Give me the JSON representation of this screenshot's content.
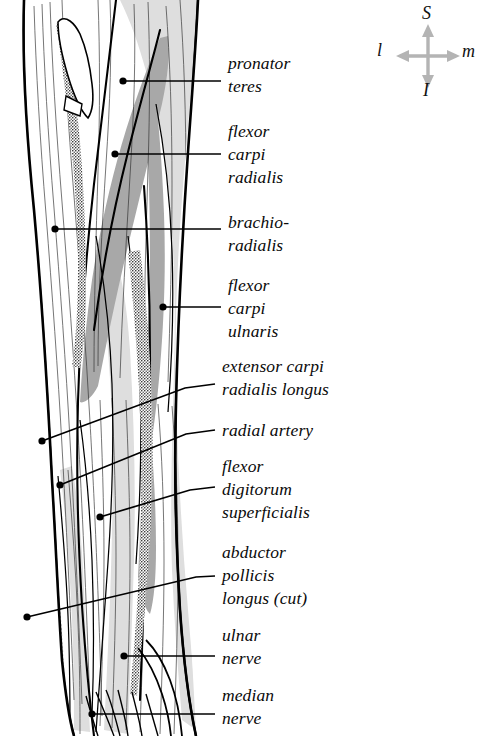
{
  "figure": {
    "view": "anterior",
    "ink_color": "#000000",
    "muscle_shade_mid": "#a9a9a9",
    "muscle_shade_light": "#dcdcdc",
    "leader_color": "#000000",
    "background": "#ffffff"
  },
  "orientation_key": {
    "name": "anatomical-orientation-compass",
    "arrow_color": "#b4b4b4",
    "superior": "S",
    "inferior": "I",
    "lateral": "l",
    "medial": "m"
  },
  "labels": [
    {
      "id": "pronator-teres",
      "lines": [
        "pronator",
        "teres"
      ],
      "text_x": 228,
      "text_y": 52,
      "leader": {
        "dot_x": 123,
        "dot_y": 81,
        "elbow_x": 221,
        "elbow_y": 81,
        "end_x": 221,
        "end_y": 81
      }
    },
    {
      "id": "flexor-carpi-radialis",
      "lines": [
        "flexor",
        "carpi",
        "radialis"
      ],
      "text_x": 228,
      "text_y": 120,
      "leader": {
        "dot_x": 115,
        "dot_y": 154,
        "elbow_x": 221,
        "elbow_y": 154,
        "end_x": 221,
        "end_y": 154
      }
    },
    {
      "id": "brachioradialis",
      "lines": [
        "brachio-",
        "radialis"
      ],
      "text_x": 228,
      "text_y": 211,
      "leader": {
        "dot_x": 55,
        "dot_y": 229,
        "elbow_x": 221,
        "elbow_y": 229,
        "end_x": 221,
        "end_y": 229
      }
    },
    {
      "id": "flexor-carpi-ulnaris",
      "lines": [
        "flexor",
        "carpi",
        "ulnaris"
      ],
      "text_x": 228,
      "text_y": 274,
      "leader": {
        "dot_x": 163,
        "dot_y": 307,
        "elbow_x": 221,
        "elbow_y": 307,
        "end_x": 221,
        "end_y": 307
      }
    },
    {
      "id": "extensor-carpi-radialis-longus",
      "lines": [
        "extensor carpi",
        "radialis longus"
      ],
      "text_x": 222,
      "text_y": 355,
      "leader": {
        "dot_x": 42,
        "dot_y": 441,
        "elbow_x": 185,
        "elbow_y": 388,
        "end_x": 215,
        "end_y": 384
      }
    },
    {
      "id": "radial-artery",
      "lines": [
        "radial artery"
      ],
      "text_x": 222,
      "text_y": 419,
      "leader": {
        "dot_x": 60,
        "dot_y": 485,
        "elbow_x": 186,
        "elbow_y": 434,
        "end_x": 215,
        "end_y": 430
      }
    },
    {
      "id": "flexor-digitorum-superficialis",
      "lines": [
        "flexor",
        "digitorum",
        "superficialis"
      ],
      "text_x": 222,
      "text_y": 455,
      "leader": {
        "dot_x": 100,
        "dot_y": 517,
        "elbow_x": 190,
        "elbow_y": 490,
        "end_x": 215,
        "end_y": 487
      }
    },
    {
      "id": "abductor-pollicis-longus",
      "lines": [
        "abductor",
        "pollicis",
        "longus (cut)"
      ],
      "text_x": 222,
      "text_y": 541,
      "leader": {
        "dot_x": 27,
        "dot_y": 617,
        "elbow_x": 196,
        "elbow_y": 577,
        "end_x": 215,
        "end_y": 576
      }
    },
    {
      "id": "ulnar-nerve",
      "lines": [
        "ulnar",
        "nerve"
      ],
      "text_x": 222,
      "text_y": 624,
      "leader": {
        "dot_x": 124,
        "dot_y": 656,
        "elbow_x": 196,
        "elbow_y": 656,
        "end_x": 215,
        "end_y": 656
      }
    },
    {
      "id": "median-nerve",
      "lines": [
        "median",
        "nerve"
      ],
      "text_x": 222,
      "text_y": 684,
      "leader": {
        "dot_x": 92,
        "dot_y": 714,
        "elbow_x": 196,
        "elbow_y": 714,
        "end_x": 215,
        "end_y": 714
      }
    }
  ]
}
